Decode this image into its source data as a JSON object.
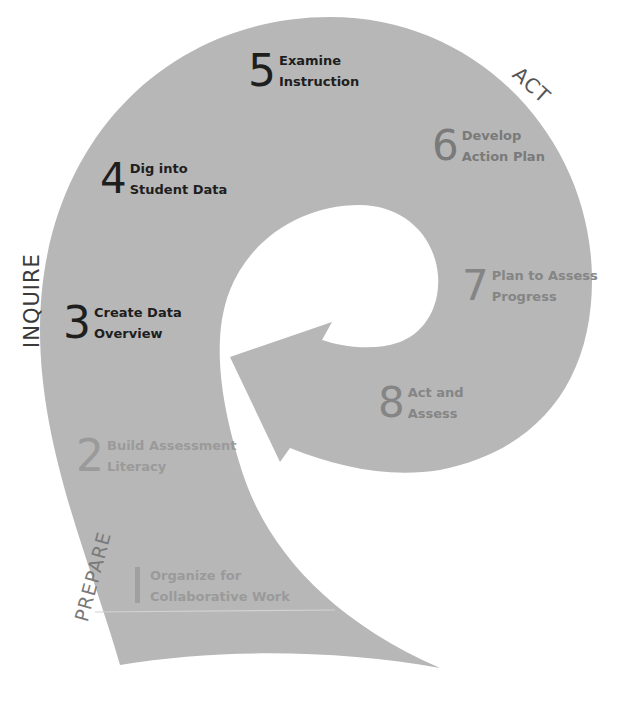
{
  "colors": {
    "shape_fill": "#b7b7b7",
    "text_dark": "#1e1e1e",
    "text_mid": "#6e6e6e",
    "text_light": "#8f8f8f",
    "phase_text": "#555555",
    "divider": "#d2d2d2"
  },
  "phases": {
    "prepare": "PREPARE",
    "inquire": "INQUIRE",
    "act": "ACT"
  },
  "steps": [
    {
      "number": "1",
      "line1": "Organize for",
      "line2": "Collaborative Work"
    },
    {
      "number": "2",
      "line1": "Build Assessment",
      "line2": "Literacy"
    },
    {
      "number": "3",
      "line1": "Create Data",
      "line2": "Overview"
    },
    {
      "number": "4",
      "line1": "Dig into",
      "line2": "Student Data"
    },
    {
      "number": "5",
      "line1": "Examine",
      "line2": "Instruction"
    },
    {
      "number": "6",
      "line1": "Develop",
      "line2": "Action Plan"
    },
    {
      "number": "7",
      "line1": "Plan to Assess",
      "line2": "Progress"
    },
    {
      "number": "8",
      "line1": "Act and",
      "line2": "Assess"
    }
  ]
}
